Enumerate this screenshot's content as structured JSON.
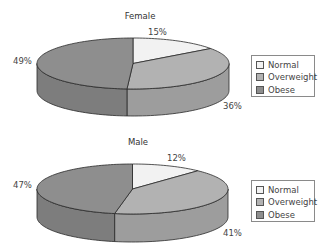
{
  "chart_data": [
    {
      "type": "pie",
      "style": "3d",
      "title": "Female",
      "categories": [
        "Normal",
        "Overweight",
        "Obese"
      ],
      "values": [
        15,
        36,
        49
      ],
      "value_labels": [
        "15%",
        "36%",
        "49%"
      ],
      "colors": [
        "#f2f2f2",
        "#b2b2b2",
        "#8e8e8e"
      ],
      "start": "12 o'clock",
      "direction": "clockwise",
      "legend": {
        "placement": "right",
        "entries": [
          "Normal",
          "Overweight",
          "Obese"
        ]
      }
    },
    {
      "type": "pie",
      "style": "3d",
      "title": "Male",
      "categories": [
        "Normal",
        "Overweight",
        "Obese"
      ],
      "values": [
        12,
        41,
        47
      ],
      "value_labels": [
        "12%",
        "41%",
        "47%"
      ],
      "colors": [
        "#f2f2f2",
        "#b2b2b2",
        "#8e8e8e"
      ],
      "start": "12 o'clock",
      "direction": "clockwise",
      "legend": {
        "placement": "right",
        "entries": [
          "Normal",
          "Overweight",
          "Obese"
        ]
      }
    }
  ]
}
